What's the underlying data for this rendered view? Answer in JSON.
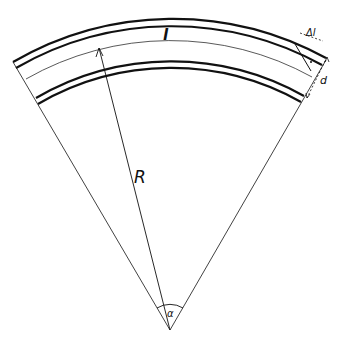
{
  "diagram": {
    "labels": {
      "arc_length": "l",
      "delta_arc": "Δl",
      "thickness": "d",
      "radius": "R",
      "angle": "α"
    },
    "colors": {
      "ink": "#111111",
      "background": "#ffffff"
    }
  }
}
